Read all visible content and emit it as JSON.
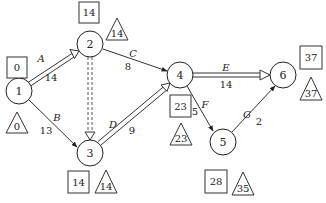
{
  "diagram": {
    "type": "activity-on-arrow network",
    "nodes": [
      {
        "id": "1",
        "label": "1",
        "x": 19,
        "y": 91,
        "early": "0",
        "late": "0"
      },
      {
        "id": "2",
        "label": "2",
        "x": 90,
        "y": 44,
        "early": "14",
        "late": "14"
      },
      {
        "id": "3",
        "label": "3",
        "x": 90,
        "y": 153,
        "early": "14",
        "late": "14"
      },
      {
        "id": "4",
        "label": "4",
        "x": 180,
        "y": 75,
        "early": "23",
        "late": "23"
      },
      {
        "id": "5",
        "label": "5",
        "x": 223,
        "y": 142,
        "early": "28",
        "late": "35"
      },
      {
        "id": "6",
        "label": "6",
        "x": 283,
        "y": 75,
        "early": "37",
        "late": "37"
      }
    ],
    "activities": [
      {
        "name": "A",
        "from": "1",
        "to": "2",
        "duration": "14",
        "critical": true
      },
      {
        "name": "B",
        "from": "1",
        "to": "3",
        "duration": "13",
        "critical": false
      },
      {
        "name": "C",
        "from": "2",
        "to": "4",
        "duration": "8",
        "critical": false
      },
      {
        "name": "",
        "from": "2",
        "to": "3",
        "duration": "",
        "critical": true,
        "dummy": true
      },
      {
        "name": "D",
        "from": "3",
        "to": "4",
        "duration": "9",
        "critical": true
      },
      {
        "name": "E",
        "from": "4",
        "to": "6",
        "duration": "14",
        "critical": true
      },
      {
        "name": "F",
        "from": "4",
        "to": "5",
        "duration": "5",
        "critical": false
      },
      {
        "name": "G",
        "from": "5",
        "to": "6",
        "duration": "2",
        "critical": false
      }
    ],
    "legend_hint": {
      "box": "earliest event time",
      "triangle": "latest event time"
    }
  }
}
